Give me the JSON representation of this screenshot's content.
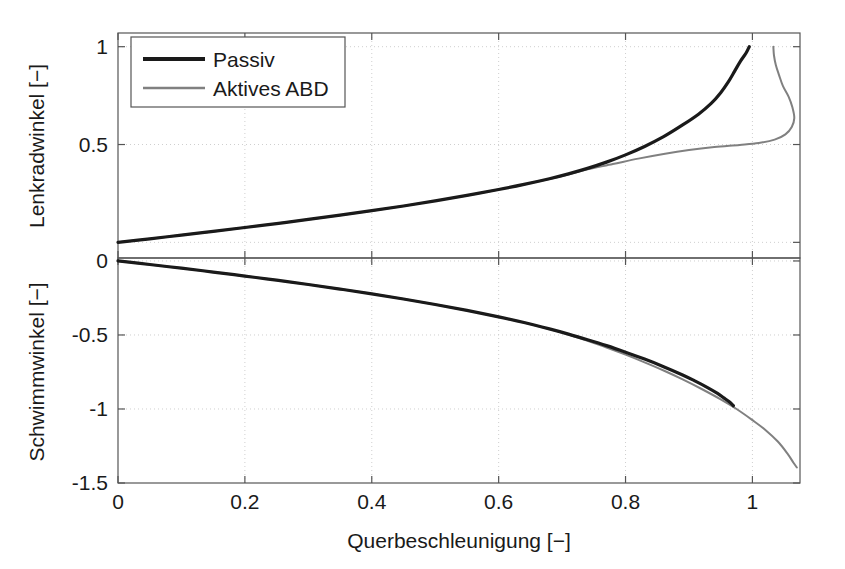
{
  "chart_data": {
    "type": "line",
    "title": "",
    "subtitle": "",
    "xlabel": "Querbeschleunigung [−]",
    "xlim": [
      0,
      1.075
    ],
    "xticks": [
      0,
      0.2,
      0.4,
      0.6,
      0.8,
      1
    ],
    "xticklabels": [
      "0",
      "0.2",
      "0.4",
      "0.6",
      "0.8",
      "1"
    ],
    "grid": true,
    "grid_style": "dotted",
    "legend_position": "upper-left",
    "legend_entries": [
      "Passiv",
      "Aktives ABD"
    ],
    "colors": {
      "passiv": "#1a1a1a",
      "aktives_abd": "#808080",
      "grid": "#cfcfcf",
      "axis": "#555555",
      "background": "#ffffff"
    },
    "subplots": [
      {
        "name": "upper",
        "ylabel": "Lenkradwinkel [−]",
        "ylim": [
          -0.08,
          1.07
        ],
        "yticks": [
          0,
          0.5,
          1
        ],
        "yticklabels": [
          "0",
          "0.5",
          "1"
        ],
        "series": [
          {
            "name": "Passiv",
            "color": "#1a1a1a",
            "width": 3.2,
            "points": [
              [
                0.0,
                0.0
              ],
              [
                0.05,
                0.018
              ],
              [
                0.1,
                0.037
              ],
              [
                0.15,
                0.056
              ],
              [
                0.2,
                0.076
              ],
              [
                0.25,
                0.096
              ],
              [
                0.3,
                0.117
              ],
              [
                0.35,
                0.139
              ],
              [
                0.4,
                0.162
              ],
              [
                0.45,
                0.186
              ],
              [
                0.5,
                0.212
              ],
              [
                0.55,
                0.24
              ],
              [
                0.6,
                0.27
              ],
              [
                0.64,
                0.296
              ],
              [
                0.68,
                0.325
              ],
              [
                0.71,
                0.35
              ],
              [
                0.74,
                0.378
              ],
              [
                0.77,
                0.41
              ],
              [
                0.8,
                0.447
              ],
              [
                0.83,
                0.49
              ],
              [
                0.86,
                0.54
              ],
              [
                0.89,
                0.6
              ],
              [
                0.915,
                0.655
              ],
              [
                0.935,
                0.71
              ],
              [
                0.95,
                0.765
              ],
              [
                0.962,
                0.82
              ],
              [
                0.972,
                0.875
              ],
              [
                0.981,
                0.925
              ],
              [
                0.99,
                0.968
              ],
              [
                0.995,
                1.0
              ]
            ]
          },
          {
            "name": "Aktives ABD",
            "color": "#808080",
            "width": 2.0,
            "points": [
              [
                0.0,
                0.0
              ],
              [
                0.05,
                0.018
              ],
              [
                0.1,
                0.037
              ],
              [
                0.15,
                0.056
              ],
              [
                0.2,
                0.076
              ],
              [
                0.25,
                0.096
              ],
              [
                0.3,
                0.117
              ],
              [
                0.35,
                0.139
              ],
              [
                0.4,
                0.162
              ],
              [
                0.45,
                0.186
              ],
              [
                0.5,
                0.212
              ],
              [
                0.55,
                0.24
              ],
              [
                0.6,
                0.27
              ],
              [
                0.64,
                0.296
              ],
              [
                0.68,
                0.324
              ],
              [
                0.71,
                0.347
              ],
              [
                0.74,
                0.373
              ],
              [
                0.78,
                0.4
              ],
              [
                0.82,
                0.428
              ],
              [
                0.86,
                0.452
              ],
              [
                0.9,
                0.472
              ],
              [
                0.94,
                0.487
              ],
              [
                0.98,
                0.498
              ],
              [
                1.01,
                0.508
              ],
              [
                1.035,
                0.525
              ],
              [
                1.052,
                0.552
              ],
              [
                1.062,
                0.59
              ],
              [
                1.066,
                0.635
              ],
              [
                1.063,
                0.69
              ],
              [
                1.057,
                0.745
              ],
              [
                1.048,
                0.8
              ],
              [
                1.042,
                0.855
              ],
              [
                1.037,
                0.905
              ],
              [
                1.034,
                0.955
              ],
              [
                1.033,
                1.0
              ]
            ]
          }
        ]
      },
      {
        "name": "lower",
        "ylabel": "Schwimmwinkel [−]",
        "ylim": [
          -1.5,
          0.02
        ],
        "yticks": [
          -1.5,
          -1,
          -0.5,
          0
        ],
        "yticklabels": [
          "-1.5",
          "-1",
          "-0.5",
          "0"
        ],
        "series": [
          {
            "name": "Passiv",
            "color": "#1a1a1a",
            "width": 3.2,
            "points": [
              [
                0.0,
                0.0
              ],
              [
                0.05,
                -0.024
              ],
              [
                0.1,
                -0.049
              ],
              [
                0.15,
                -0.075
              ],
              [
                0.2,
                -0.102
              ],
              [
                0.25,
                -0.13
              ],
              [
                0.3,
                -0.159
              ],
              [
                0.35,
                -0.19
              ],
              [
                0.4,
                -0.222
              ],
              [
                0.45,
                -0.257
              ],
              [
                0.5,
                -0.294
              ],
              [
                0.55,
                -0.334
              ],
              [
                0.6,
                -0.378
              ],
              [
                0.64,
                -0.416
              ],
              [
                0.68,
                -0.459
              ],
              [
                0.71,
                -0.494
              ],
              [
                0.74,
                -0.532
              ],
              [
                0.77,
                -0.572
              ],
              [
                0.8,
                -0.616
              ],
              [
                0.83,
                -0.663
              ],
              [
                0.86,
                -0.714
              ],
              [
                0.89,
                -0.77
              ],
              [
                0.91,
                -0.812
              ],
              [
                0.93,
                -0.857
              ],
              [
                0.945,
                -0.895
              ],
              [
                0.955,
                -0.925
              ],
              [
                0.963,
                -0.95
              ],
              [
                0.97,
                -0.978
              ]
            ]
          },
          {
            "name": "Aktives ABD",
            "color": "#808080",
            "width": 2.0,
            "points": [
              [
                0.0,
                0.0
              ],
              [
                0.05,
                -0.024
              ],
              [
                0.1,
                -0.049
              ],
              [
                0.15,
                -0.075
              ],
              [
                0.2,
                -0.102
              ],
              [
                0.25,
                -0.13
              ],
              [
                0.3,
                -0.159
              ],
              [
                0.35,
                -0.19
              ],
              [
                0.4,
                -0.222
              ],
              [
                0.45,
                -0.257
              ],
              [
                0.5,
                -0.294
              ],
              [
                0.55,
                -0.334
              ],
              [
                0.6,
                -0.378
              ],
              [
                0.64,
                -0.416
              ],
              [
                0.68,
                -0.46
              ],
              [
                0.71,
                -0.497
              ],
              [
                0.74,
                -0.54
              ],
              [
                0.77,
                -0.585
              ],
              [
                0.8,
                -0.633
              ],
              [
                0.83,
                -0.685
              ],
              [
                0.86,
                -0.74
              ],
              [
                0.89,
                -0.8
              ],
              [
                0.92,
                -0.865
              ],
              [
                0.95,
                -0.935
              ],
              [
                0.975,
                -1.0
              ],
              [
                1.0,
                -1.075
              ],
              [
                1.02,
                -1.14
              ],
              [
                1.04,
                -1.22
              ],
              [
                1.055,
                -1.3
              ],
              [
                1.065,
                -1.365
              ],
              [
                1.07,
                -1.395
              ]
            ]
          }
        ]
      }
    ]
  },
  "geometry": {
    "plot_left": 118,
    "plot_right": 800,
    "plot_top": 33,
    "plot_mid": 258,
    "plot_bottom": 483
  }
}
